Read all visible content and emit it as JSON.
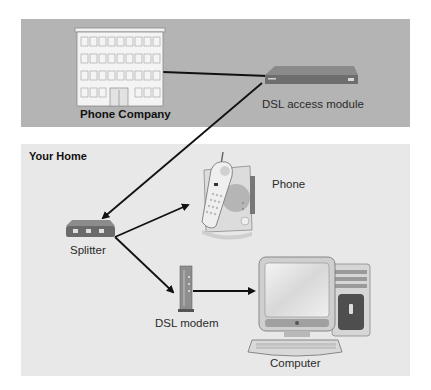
{
  "diagram": {
    "top_panel": {
      "color": "#b4b4b4",
      "building_label": "Phone Company",
      "access_module_label": "DSL access module"
    },
    "home_panel": {
      "color": "#e8e8e8",
      "title": "Your Home",
      "splitter_label": "Splitter",
      "phone_label": "Phone",
      "modem_label": "DSL modem",
      "computer_label": "Computer"
    },
    "connections": [
      {
        "from": "Phone Company",
        "to": "DSL access module",
        "type": "line"
      },
      {
        "from": "DSL access module",
        "to": "Splitter",
        "type": "arrow"
      },
      {
        "from": "Splitter",
        "to": "Phone",
        "type": "arrow"
      },
      {
        "from": "Splitter",
        "to": "DSL modem",
        "type": "arrow"
      },
      {
        "from": "DSL modem",
        "to": "Computer",
        "type": "arrow"
      }
    ]
  }
}
